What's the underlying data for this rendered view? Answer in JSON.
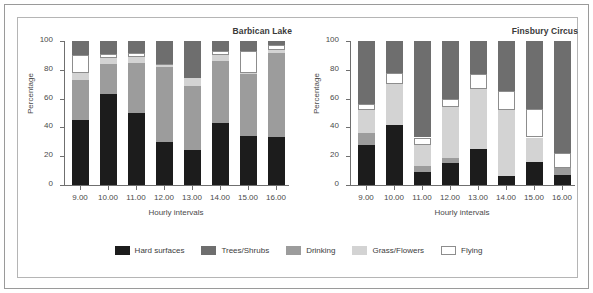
{
  "figure": {
    "xlabel": "Hourly intervals",
    "ylabel": "Percentage"
  },
  "legend": {
    "items": [
      {
        "label": "Hard surfaces",
        "color": "#1c1c1c"
      },
      {
        "label": "Trees/Shrubs",
        "color": "#6e6e6e"
      },
      {
        "label": "Drinking",
        "color": "#9c9c9c"
      },
      {
        "label": "Grass/Flowers",
        "color": "#d3d3d3"
      },
      {
        "label": "Flying",
        "color": "#ffffff"
      }
    ]
  },
  "chart_data": [
    {
      "type": "bar",
      "stacked": true,
      "title": "Barbican Lake",
      "xlabel": "Hourly intervals",
      "ylabel": "Percentage",
      "ylim": [
        0,
        100
      ],
      "yticks": [
        0,
        20,
        40,
        60,
        80,
        100
      ],
      "grid": false,
      "legend_position": "bottom-shared",
      "categories": [
        "9.00",
        "10.00",
        "11.00",
        "12.00",
        "13.00",
        "14.00",
        "15.00",
        "16.00"
      ],
      "series": [
        {
          "name": "Hard surfaces",
          "color": "#1c1c1c",
          "values": [
            45,
            63,
            50,
            30,
            24,
            43,
            34,
            33
          ]
        },
        {
          "name": "Drinking",
          "color": "#9c9c9c",
          "values": [
            28,
            21,
            35,
            52,
            45,
            43,
            43,
            59
          ]
        },
        {
          "name": "Grass/Flowers",
          "color": "#d3d3d3",
          "values": [
            5,
            4,
            4,
            1,
            5,
            4,
            1,
            2
          ]
        },
        {
          "name": "Flying",
          "color": "#ffffff",
          "values": [
            12,
            3,
            3,
            1,
            0,
            3,
            15,
            3
          ]
        },
        {
          "name": "Trees/Shrubs",
          "color": "#6e6e6e",
          "values": [
            10,
            9,
            8,
            16,
            26,
            7,
            7,
            3
          ]
        }
      ]
    },
    {
      "type": "bar",
      "stacked": true,
      "title": "Finsbury Circus",
      "xlabel": "Hourly intervals",
      "ylabel": "Percentage",
      "ylim": [
        0,
        100
      ],
      "yticks": [
        0,
        20,
        40,
        60,
        80,
        100
      ],
      "grid": false,
      "legend_position": "bottom-shared",
      "categories": [
        "9.00",
        "10.00",
        "11.00",
        "12.00",
        "13.00",
        "14.00",
        "15.00",
        "16.00"
      ],
      "series": [
        {
          "name": "Hard surfaces",
          "color": "#1c1c1c",
          "values": [
            28,
            42,
            9,
            15,
            25,
            6,
            16,
            7
          ]
        },
        {
          "name": "Drinking",
          "color": "#9c9c9c",
          "values": [
            8,
            0,
            4,
            4,
            0,
            0,
            0,
            5
          ]
        },
        {
          "name": "Grass/Flowers",
          "color": "#d3d3d3",
          "values": [
            16,
            28,
            15,
            35,
            42,
            46,
            17,
            0
          ]
        },
        {
          "name": "Flying",
          "color": "#ffffff",
          "values": [
            4,
            8,
            5,
            6,
            10,
            13,
            20,
            10
          ]
        },
        {
          "name": "Trees/Shrubs",
          "color": "#6e6e6e",
          "values": [
            44,
            22,
            67,
            40,
            23,
            35,
            47,
            78
          ]
        }
      ]
    }
  ]
}
